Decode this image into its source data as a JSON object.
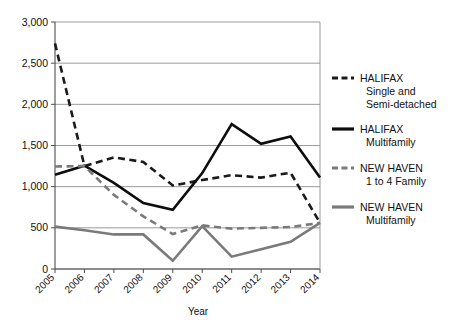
{
  "chart_data": {
    "type": "line",
    "title": "",
    "xlabel": "Year",
    "ylabel": "",
    "categories": [
      "2005",
      "2006",
      "2007",
      "2008",
      "2009",
      "2010",
      "2011",
      "2012",
      "2013",
      "2014"
    ],
    "x": [
      2005,
      2006,
      2007,
      2008,
      2009,
      2010,
      2011,
      2012,
      2013,
      2014
    ],
    "xlim": [
      2005,
      2014
    ],
    "ylim": [
      0,
      3000
    ],
    "yticks": [
      0,
      500,
      1000,
      1500,
      2000,
      2500,
      3000
    ],
    "ytick_labels": [
      "0",
      "500",
      "1,000",
      "1,500",
      "2,000",
      "2,500",
      "3,000"
    ],
    "grid": "horizontal",
    "legend_position": "right",
    "series": [
      {
        "name": "HALIFAX Single and Semi-detached",
        "legend_label_line1": "HALIFAX",
        "legend_label_line2": "Single and",
        "legend_label_line3": "Semi-detached",
        "style": "dashed",
        "color": "#1a1a1a",
        "width": 2.6,
        "values": [
          2740,
          1250,
          1355,
          1300,
          1015,
          1080,
          1140,
          1110,
          1170,
          560
        ]
      },
      {
        "name": "HALIFAX Multifamily",
        "legend_label_line1": "HALIFAX",
        "legend_label_line2": "Multifamily",
        "style": "solid",
        "color": "#0d0d0d",
        "width": 2.6,
        "values": [
          1145,
          1255,
          1045,
          800,
          720,
          1165,
          1760,
          1520,
          1610,
          1110
        ]
      },
      {
        "name": "NEW HAVEN 1 to 4 Family",
        "legend_label_line1": "NEW HAVEN",
        "legend_label_line2": "1 to 4 Family",
        "style": "dashed",
        "color": "#7a7a7a",
        "width": 2.6,
        "values": [
          1245,
          1250,
          900,
          640,
          425,
          530,
          490,
          500,
          510,
          560
        ]
      },
      {
        "name": "NEW HAVEN Multifamily",
        "legend_label_line1": "NEW HAVEN",
        "legend_label_line2": "Multifamily",
        "style": "solid",
        "color": "#7a7a7a",
        "width": 2.6,
        "values": [
          515,
          470,
          420,
          420,
          100,
          520,
          150,
          240,
          330,
          560
        ]
      }
    ]
  }
}
